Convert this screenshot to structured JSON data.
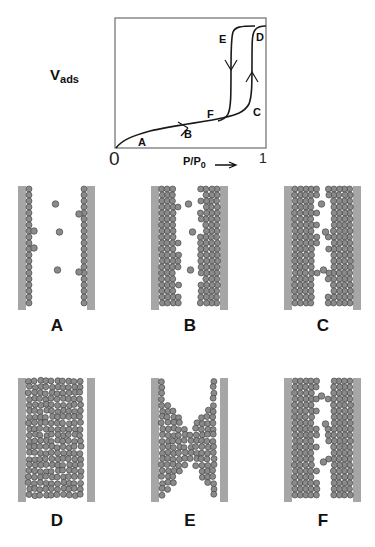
{
  "figure": {
    "isotherm": {
      "ylabel_main": "V",
      "ylabel_sub": "ads",
      "xlabel_main": "P/P",
      "xlabel_sub": "0",
      "xlabel_arrow": "⟶",
      "x_tick_min": "0",
      "x_tick_max": "1",
      "points": {
        "A": "A",
        "B": "B",
        "C": "C",
        "D": "D",
        "E": "E",
        "F": "F"
      },
      "line_color": "#1a1a1a",
      "box_color": "#777777"
    },
    "panels": [
      {
        "label": "A",
        "state": "monolayer adsorption",
        "layers": 1,
        "vapor_molecules": 3,
        "extra_bumps": 4
      },
      {
        "label": "B",
        "state": "multilayer adsorption",
        "layers": 3,
        "vapor_molecules": 3,
        "extra_bumps": 0
      },
      {
        "label": "C",
        "state": "thick film before condensation",
        "layers": 4,
        "vapor_molecules": 3,
        "extra_bumps": 0
      },
      {
        "label": "D",
        "state": "pore filled (capillary condensate)",
        "layers": 0,
        "vapor_molecules": 0,
        "extra_bumps": 0
      },
      {
        "label": "E",
        "state": "meniscus during desorption",
        "layers": 0,
        "vapor_molecules": 0,
        "extra_bumps": 0
      },
      {
        "label": "F",
        "state": "after evaporation, adsorbed film remains",
        "layers": 4,
        "vapor_molecules": 3,
        "extra_bumps": 0
      }
    ],
    "colors": {
      "wall": "#a6a6a6",
      "bead_fill": "#8a8a8a",
      "bead_stroke": "#3a3a3a",
      "bead_highlight": "#c8c8c8"
    }
  }
}
